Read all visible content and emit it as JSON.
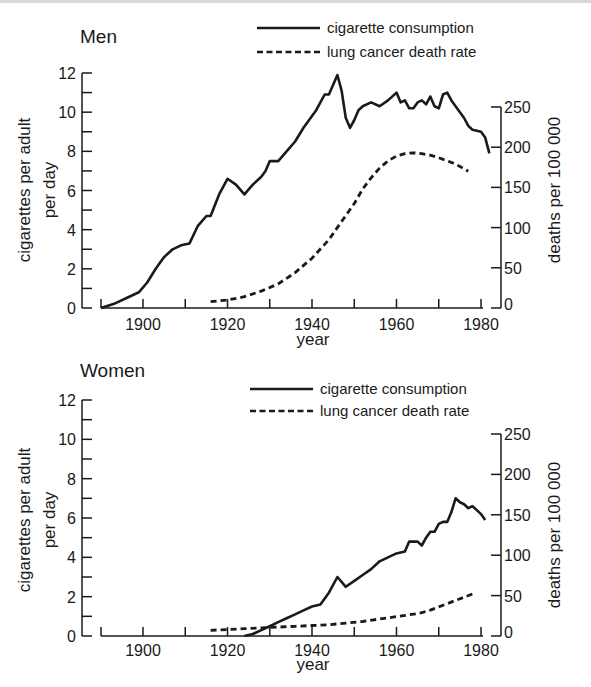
{
  "chart_data": [
    {
      "type": "line",
      "title": "Men",
      "xlabel": "year",
      "ylabel": "cigarettes per adult per day",
      "y2label": "deaths per 100 000",
      "xlim": [
        1890,
        1982
      ],
      "ylim": [
        0,
        12
      ],
      "y2lim": [
        0,
        250
      ],
      "xticks": [
        "1900",
        "1920",
        "1940",
        "1960",
        "1980"
      ],
      "yticks": [
        "0",
        "2",
        "4",
        "6",
        "8",
        "10",
        "12"
      ],
      "y2ticks": [
        "0",
        "50",
        "100",
        "150",
        "200",
        "250"
      ],
      "legend": [
        "cigarette consumption",
        "lung cancer death rate"
      ],
      "legend_position": "top-right",
      "grid": false,
      "series": [
        {
          "name": "cigarette consumption",
          "axis": "left",
          "style": "solid",
          "x": [
            1890,
            1893,
            1896,
            1899,
            1901,
            1903,
            1905,
            1907,
            1909,
            1911,
            1913,
            1915,
            1916,
            1918,
            1920,
            1922,
            1924,
            1926,
            1928,
            1929,
            1930,
            1932,
            1934,
            1936,
            1938,
            1940,
            1941,
            1942,
            1943,
            1944,
            1946,
            1947,
            1948,
            1949,
            1950,
            1951,
            1952,
            1954,
            1956,
            1958,
            1960,
            1961,
            1962,
            1963,
            1964,
            1965,
            1966,
            1967,
            1968,
            1969,
            1970,
            1971,
            1972,
            1973,
            1974,
            1975,
            1976,
            1977,
            1978,
            1980,
            1981,
            1982
          ],
          "values": [
            0.0,
            0.2,
            0.5,
            0.8,
            1.3,
            2.0,
            2.6,
            3.0,
            3.2,
            3.3,
            4.2,
            4.7,
            4.7,
            5.8,
            6.6,
            6.3,
            5.8,
            6.3,
            6.7,
            7.0,
            7.5,
            7.5,
            8.0,
            8.5,
            9.2,
            9.8,
            10.1,
            10.5,
            10.9,
            10.9,
            11.9,
            11.1,
            9.7,
            9.2,
            9.6,
            10.1,
            10.3,
            10.5,
            10.3,
            10.6,
            11.0,
            10.5,
            10.6,
            10.2,
            10.2,
            10.5,
            10.6,
            10.4,
            10.8,
            10.3,
            10.2,
            10.9,
            11.0,
            10.6,
            10.3,
            10.0,
            9.7,
            9.3,
            9.1,
            9.0,
            8.7,
            7.9
          ]
        },
        {
          "name": "lung cancer death rate",
          "axis": "right",
          "style": "dashed",
          "x": [
            1916,
            1920,
            1924,
            1928,
            1932,
            1936,
            1940,
            1944,
            1948,
            1950,
            1952,
            1954,
            1956,
            1958,
            1960,
            1962,
            1964,
            1966,
            1968,
            1970,
            1972,
            1974,
            1976,
            1977
          ],
          "values": [
            8,
            10,
            14,
            21,
            30,
            44,
            62,
            85,
            115,
            130,
            148,
            162,
            174,
            183,
            189,
            192,
            193,
            192,
            190,
            187,
            183,
            179,
            173,
            170
          ]
        }
      ]
    },
    {
      "type": "line",
      "title": "Women",
      "xlabel": "year",
      "ylabel": "cigarettes per adult per day",
      "y2label": "deaths per 100 000",
      "xlim": [
        1890,
        1982
      ],
      "ylim": [
        0,
        12
      ],
      "y2lim": [
        0,
        250
      ],
      "xticks": [
        "1900",
        "1920",
        "1940",
        "1960",
        "1980"
      ],
      "yticks": [
        "0",
        "2",
        "4",
        "6",
        "8",
        "10",
        "12"
      ],
      "y2ticks": [
        "0",
        "50",
        "100",
        "150",
        "200",
        "250"
      ],
      "legend": [
        "cigarette consumption",
        "lung cancer death rate"
      ],
      "legend_position": "top-right",
      "grid": false,
      "series": [
        {
          "name": "cigarette consumption",
          "axis": "left",
          "style": "solid",
          "x": [
            1924,
            1926,
            1928,
            1930,
            1932,
            1934,
            1936,
            1938,
            1940,
            1942,
            1944,
            1946,
            1948,
            1950,
            1952,
            1954,
            1956,
            1958,
            1960,
            1962,
            1963,
            1965,
            1966,
            1967,
            1968,
            1969,
            1970,
            1971,
            1972,
            1973,
            1974,
            1975,
            1976,
            1977,
            1978,
            1979,
            1980,
            1981
          ],
          "values": [
            0.0,
            0.1,
            0.3,
            0.5,
            0.7,
            0.9,
            1.1,
            1.3,
            1.5,
            1.6,
            2.2,
            3.0,
            2.5,
            2.8,
            3.1,
            3.4,
            3.8,
            4.0,
            4.2,
            4.3,
            4.8,
            4.8,
            4.6,
            5.0,
            5.3,
            5.3,
            5.7,
            5.8,
            5.8,
            6.3,
            7.0,
            6.8,
            6.7,
            6.5,
            6.6,
            6.4,
            6.2,
            5.9
          ]
        },
        {
          "name": "lung cancer death rate",
          "axis": "right",
          "style": "dashed",
          "x": [
            1916,
            1920,
            1924,
            1928,
            1932,
            1936,
            1940,
            1944,
            1948,
            1952,
            1956,
            1960,
            1964,
            1966,
            1968,
            1970,
            1972,
            1974,
            1976,
            1978
          ],
          "values": [
            7,
            8,
            9,
            10,
            11,
            12,
            13,
            14,
            16,
            18,
            21,
            24,
            27,
            29,
            32,
            36,
            40,
            44,
            48,
            52
          ]
        }
      ]
    }
  ],
  "charts": [
    {
      "title": "Men",
      "ylabel_line1": "cigarettes per adult",
      "ylabel_line2": "per day",
      "y2label": "deaths per 100 000",
      "xlabel": "year",
      "legend_solid": "cigarette consumption",
      "legend_dashed": "lung cancer death rate"
    },
    {
      "title": "Women",
      "ylabel_line1": "cigarettes per adult",
      "ylabel_line2": "per day",
      "y2label": "deaths per 100 000",
      "xlabel": "year",
      "legend_solid": "cigarette consumption",
      "legend_dashed": "lung cancer death rate"
    }
  ],
  "colors": {
    "ink": "#1a1a1a",
    "background": "#ffffff"
  }
}
